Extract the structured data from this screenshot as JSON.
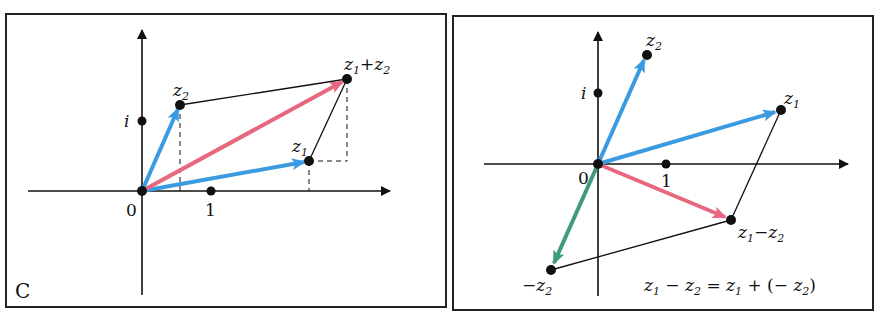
{
  "figure": {
    "panel_letter": "C",
    "colors": {
      "blue_vector": "#3a9be0",
      "red_vector": "#e8677f",
      "green_vector": "#3f9b7c",
      "axis": "#111111",
      "frame": "#222222"
    },
    "left_panel": {
      "title": "Vector addition",
      "labels": {
        "origin": "0",
        "one": "1",
        "i": "i",
        "z2": "z",
        "z2_sub": "2",
        "z1": "z",
        "z1_sub": "1",
        "sum_a": "z",
        "sum_a_sub": "1",
        "sum_plus": "+",
        "sum_b": "z",
        "sum_b_sub": "2"
      }
    },
    "right_panel": {
      "title": "Vector subtraction",
      "labels": {
        "origin": "0",
        "one": "1",
        "i": "i",
        "z2": "z",
        "z2_sub": "2",
        "z1": "z",
        "z1_sub": "1",
        "diff_a": "z",
        "diff_a_sub": "1",
        "diff_minus": "−",
        "diff_b": "z",
        "diff_b_sub": "2",
        "neg_minus": "−",
        "neg_z": "z",
        "neg_sub": "2"
      },
      "equation": {
        "a": "z",
        "a_sub": "1",
        "minus": " − ",
        "b": "z",
        "b_sub": "2",
        "eq": " = ",
        "c": "z",
        "c_sub": "1",
        "plus": " + (− ",
        "d": "z",
        "d_sub": "2",
        "close": ")"
      }
    }
  }
}
